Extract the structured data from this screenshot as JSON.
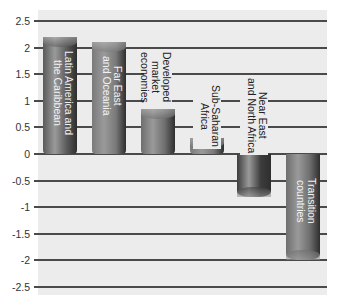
{
  "chart_data": {
    "type": "bar",
    "title": "",
    "xlabel": "",
    "ylabel": "",
    "ylim": [
      -2.5,
      2.5
    ],
    "yticks": [
      "2.5",
      "2",
      "1.5",
      "1",
      "0.5",
      "0",
      "-0.5",
      "-1",
      "-1.5",
      "-2",
      "-2.5"
    ],
    "grid": true,
    "legend": "none",
    "categories": [
      "Latin America and the Caribbean",
      "Far East and Oceania",
      "Developed market economies",
      "Sub-Saharan Africa",
      "Near East and North Africa",
      "Transition countries"
    ],
    "values": [
      2.2,
      2.1,
      0.85,
      0.3,
      -0.8,
      -2.0
    ]
  },
  "bars": [
    {
      "label": "Latin America and\nthe Caribbean",
      "value": 2.2,
      "color": "#5a5a5a",
      "label_pos": "inside"
    },
    {
      "label": "Far East\nand Oceania",
      "value": 2.1,
      "color": "#7a7a7a",
      "label_pos": "inside"
    },
    {
      "label": "Developed\nmarket\neconomies",
      "value": 0.85,
      "color": "#6e6e6e",
      "label_pos": "outside"
    },
    {
      "label": "Sub-Saharan\nAfrica",
      "value": 0.3,
      "color": "#7a7a7a",
      "label_pos": "outside"
    },
    {
      "label": "Near East\nand North Africa",
      "value": -0.8,
      "color": "#3c3c3c",
      "label_pos": "outside"
    },
    {
      "label": "Transition\ncountries",
      "value": -2.0,
      "color": "#6e6e6e",
      "label_pos": "inside"
    }
  ]
}
